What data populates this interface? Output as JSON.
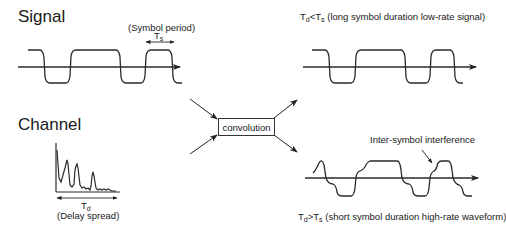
{
  "signal": {
    "title": "Signal",
    "symbol_period_label": "(Symbol period)",
    "ts_label": "T",
    "ts_sub": "s"
  },
  "channel": {
    "title": "Channel",
    "td_label": "T",
    "td_sub": "d",
    "delay_spread_label": "(Delay spread)"
  },
  "convolution": {
    "label": "convolution"
  },
  "output_low_rate": {
    "caption_td": "T",
    "caption_td_sub": "d",
    "caption_relation": "<",
    "caption_ts": "T",
    "caption_ts_sub": "s",
    "caption_text": " (long symbol duration low-rate signal)"
  },
  "output_high_rate": {
    "caption_td": "T",
    "caption_td_sub": "d",
    "caption_relation": ">",
    "caption_ts": "T",
    "caption_ts_sub": "s",
    "caption_text": " (short symbol duration high-rate waveform)",
    "isi_label": "Inter-symbol interference"
  },
  "colors": {
    "line": "#2a2a2a",
    "background": "#ffffff"
  }
}
